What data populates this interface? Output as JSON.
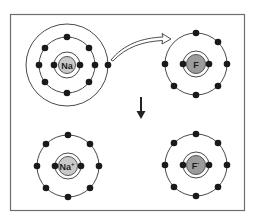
{
  "diagram": {
    "colors": {
      "frame": "#6e6e6e",
      "shell": "#4a4a4a",
      "electron": "#1a1a1a",
      "na_nucleus": "#c9c9c9",
      "f_nucleus": "#9c9c9c"
    },
    "atoms": [
      {
        "id": "na",
        "label": "Na",
        "charge": "",
        "state": "neutral",
        "center": [
          67,
          65
        ],
        "shells": [
          {
            "radius": 13,
            "electrons": 2
          },
          {
            "radius": 28,
            "electrons": 8
          },
          {
            "radius": 41,
            "electrons": 1
          }
        ]
      },
      {
        "id": "f",
        "label": "F",
        "charge": "",
        "state": "neutral",
        "center": [
          196,
          64
        ],
        "shells": [
          {
            "radius": 13,
            "electrons": 2
          },
          {
            "radius": 31,
            "electrons": 7
          }
        ]
      },
      {
        "id": "na-ion",
        "label": "Na",
        "charge": "+",
        "state": "cation",
        "center": [
          68,
          166
        ],
        "shells": [
          {
            "radius": 13,
            "electrons": 2
          },
          {
            "radius": 31,
            "electrons": 8
          }
        ]
      },
      {
        "id": "f-ion",
        "label": "F",
        "charge": "-",
        "state": "anion",
        "center": [
          196,
          165
        ],
        "shells": [
          {
            "radius": 13,
            "electrons": 2
          },
          {
            "radius": 31,
            "electrons": 8
          }
        ]
      }
    ],
    "arrows": [
      {
        "type": "curved-transfer",
        "from": "na outer electron",
        "to": "f outer shell"
      },
      {
        "type": "reaction",
        "direction": "down"
      }
    ]
  }
}
